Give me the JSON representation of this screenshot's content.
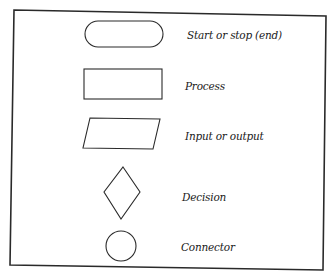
{
  "legend": {
    "items": [
      {
        "shape": "terminal",
        "label": "Start or stop (end)"
      },
      {
        "shape": "process",
        "label": "Process"
      },
      {
        "shape": "input-output",
        "label": "Input or output"
      },
      {
        "shape": "decision",
        "label": "Decision"
      },
      {
        "shape": "connector",
        "label": "Connector"
      }
    ]
  },
  "colors": {
    "stroke": "#2a2a2a",
    "background": "#ffffff"
  }
}
